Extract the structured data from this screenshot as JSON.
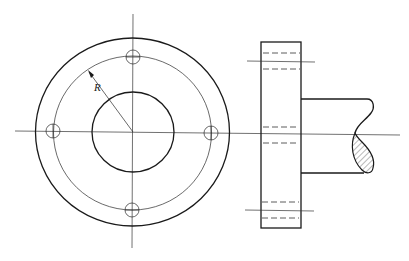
{
  "figure": {
    "labels": {
      "radius": "R"
    },
    "views": [
      {
        "name": "front-view",
        "description": "Circular flange with hub and four bolt holes on bolt circle"
      },
      {
        "name": "side-view",
        "description": "Flange side profile with hidden bolt holes and shaft with break section"
      }
    ],
    "bolt_hole_count": 4,
    "colors": {
      "line": "#1a1a1a",
      "background": "#ffffff"
    }
  }
}
